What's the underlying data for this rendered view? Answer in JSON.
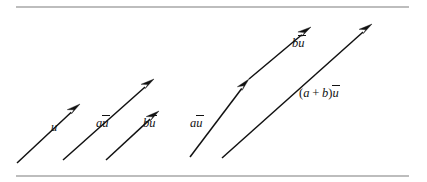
{
  "figure": {
    "background_color": "#ffffff",
    "ink_color": "#111111",
    "rule_color": "#7d7d7d",
    "rules": [
      {
        "name": "top-rule",
        "x1": 16,
        "y1": 7,
        "x2": 409,
        "y2": 7
      },
      {
        "name": "bottom-rule",
        "x1": 16,
        "y1": 176,
        "x2": 409,
        "y2": 176
      }
    ],
    "labels": {
      "u": {
        "text": "u",
        "has_vector_bar": false
      },
      "au_left": {
        "lead": "a",
        "vec": "u",
        "text": "au"
      },
      "bu_left": {
        "lead": "b",
        "vec": "u",
        "text": "bu"
      },
      "au_mid": {
        "lead": "a",
        "vec": "u",
        "text": "au"
      },
      "bu_top": {
        "lead": "b",
        "vec": "u",
        "text": "bu"
      },
      "sum": {
        "lead": "(a + b)",
        "vec": "u",
        "text": "(a + b)u"
      }
    },
    "vectors": [
      {
        "name": "vector-u",
        "label_key": "u",
        "label_text": "u",
        "start": {
          "x": 17,
          "y": 163
        },
        "end": {
          "x": 80,
          "y": 104
        },
        "label_pos": {
          "x": 51,
          "y": 128
        }
      },
      {
        "name": "vector-au-left",
        "label_key": "au_left",
        "label_text": "au",
        "start": {
          "x": 63,
          "y": 160
        },
        "end": {
          "x": 154,
          "y": 79
        },
        "label_pos": {
          "x": 96,
          "y": 124
        }
      },
      {
        "name": "vector-bu-left",
        "label_key": "bu_left",
        "label_text": "bu",
        "start": {
          "x": 106,
          "y": 160
        },
        "end": {
          "x": 159,
          "y": 111
        },
        "label_pos": {
          "x": 143,
          "y": 124
        }
      },
      {
        "name": "vector-au-mid",
        "label_key": "au_mid",
        "label_text": "au",
        "start": {
          "x": 190,
          "y": 157
        },
        "end": {
          "x": 249,
          "y": 79
        },
        "label_pos": {
          "x": 190,
          "y": 124
        }
      },
      {
        "name": "vector-bu-top",
        "label_key": "bu_top",
        "label_text": "bu",
        "start": {
          "x": 249,
          "y": 79
        },
        "end": {
          "x": 311,
          "y": 27
        },
        "label_pos": {
          "x": 292,
          "y": 44
        }
      },
      {
        "name": "vector-sum",
        "label_key": "sum",
        "label_text": "(a + b)u",
        "start": {
          "x": 222,
          "y": 158
        },
        "end": {
          "x": 372,
          "y": 24
        },
        "label_pos": {
          "x": 299,
          "y": 94
        }
      }
    ]
  }
}
